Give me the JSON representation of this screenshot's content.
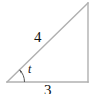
{
  "figure": {
    "type": "right-triangle-diagram",
    "background_color": "#ffffff",
    "stroke_color": "#b0b0b0",
    "text_color": "#111111",
    "labels": {
      "hypotenuse": "4",
      "base": "3",
      "angle": "t"
    },
    "geometry": {
      "left_vertex": [
        7,
        82
      ],
      "right_vertex": [
        88,
        82
      ],
      "apex": [
        88,
        3
      ],
      "angle_arc_radius": 17,
      "right_angle_marker": false
    }
  }
}
